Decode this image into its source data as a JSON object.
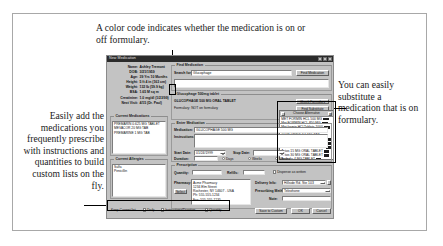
{
  "figure": {
    "captions": {
      "top": "A color code indicates whether the medication is on or off formulary.",
      "left": "Easily add the medications you frequently prescribe with instructions and quantities to build custom lists on the fly.",
      "right": "You can easily substitute a medication that is on formulary."
    }
  },
  "app": {
    "title": "New Medication",
    "window_buttons": [
      "minimize",
      "maximize",
      "close"
    ],
    "patient": [
      {
        "key": "Name:",
        "value": "Ashley Tremont"
      },
      {
        "key": "DOB:",
        "value": "3/21/1959"
      },
      {
        "key": "Age:",
        "value": "39 Yrs 10 Months"
      },
      {
        "key": "Height:",
        "value": "5 ft 4 in (163 cm)"
      },
      {
        "key": "Weight:",
        "value": "132 lb (59.9 kg)"
      },
      {
        "key": "BSA:",
        "value": "1.65 M sq m"
      },
      {
        "key": "Creatinine:",
        "value": "1.0 mg/dl (1/23/99)"
      },
      {
        "key": "Next Visit:",
        "value": "4/15 (Dr. Paul)"
      }
    ],
    "find_medication": {
      "legend": "Find Medication",
      "search_label": "Search for:",
      "search_value": "Glucophage",
      "search_button": "Find Medication",
      "results_value": ""
    },
    "selected": {
      "legend": "Glucophage 500mg tablet",
      "name": "GLUCOPHAGE 500 MG ORAL TABLET",
      "desc_label": "Formulary: NOT on formulary",
      "btn_formulary": "Check Formulary",
      "btn_substitute": "Find Substitute"
    },
    "substitute_list": {
      "header": "Choose Alternative",
      "close_label": "x",
      "items": [
        {
          "name": "MET FORMIN HCL 500 MG",
          "code": "ON"
        },
        {
          "name": "Met FORMIN HCL 850 MG",
          "code": "ON"
        },
        {
          "name": "Met formin HCl Tablets 1000",
          "code": "ON"
        },
        {
          "name": "GLYB URIDE 5 MG TAB",
          "code": "ON"
        },
        {
          "name": "GLYB URIDE 2.5 MG TAB",
          "code": "ON"
        },
        {
          "name": "Glipizide 5 MG ORAL TABLET",
          "code": "ON"
        },
        {
          "name": "Glipizide 10 MG ORAL TABLET",
          "code": "ON"
        },
        {
          "name": "Glucotrol XL 5 MG ORAL TABLET",
          "code": "ON"
        },
        {
          "name": "Actos 15 MG ORAL TABLET",
          "code": "OFF"
        },
        {
          "name": "Actos 30 MG ORAL TABLET",
          "code": "OFF"
        },
        {
          "name": "Avandia 4 MG TABLET",
          "code": "OFF"
        }
      ]
    },
    "current_medications": {
      "legend": "Current Medications",
      "items": [
        "PREMARIN 0.625 MG TABLET",
        "MEVACOR 20 MG TAB",
        "PREMARINE 1 MG TAB"
      ]
    },
    "current_allergies": {
      "legend": "Current Allergies",
      "items": [
        "Sulfa",
        "Penicillin"
      ]
    },
    "enter_medication": {
      "legend": "Enter Medication",
      "medication_label": "Medication:",
      "medication_value": "GLUCOPHAGE 500 MG",
      "instructions_label": "Instructions:",
      "instructions_value": "",
      "start_date_label": "Start Date:",
      "start_date_value": "01/24/1999",
      "stop_date_label": "Stop Date:",
      "stop_date_value": "",
      "duration_label": "Duration:",
      "duration_value": "",
      "duration_units": [
        "Days",
        "Weeks",
        "Months"
      ]
    },
    "prescription": {
      "legend": "Prescription",
      "quantity_label": "Quantity:",
      "quantity_value": "",
      "refills_label": "Refills:",
      "refills_value": "",
      "dispense_label": "Dispense as written",
      "pharmacy_label": "Pharmacy:",
      "pharmacy_select_button": "Select",
      "pharmacy_value": "Acme Pharmacy\n1234 Elm Street\nRochester, NY 14607 - USA\nPh: 555-555-1234\nFax: 555-555-1235",
      "delivery_label": "Delivery Info:",
      "delivery_value": "Hillside Rd. Ste 103",
      "prescribing_label": "Prescribing Method:",
      "prescribing_value": "Telephone",
      "notes_label": "Note:",
      "notes_value": ""
    },
    "footer": {
      "checkboxes": [
        {
          "label": "Keep Current list",
          "checked": false
        },
        {
          "label": "Daily",
          "checked": false
        },
        {
          "label": "Instructions/Duration",
          "checked": false
        },
        {
          "label": "Quantity",
          "checked": false
        }
      ],
      "buttons": [
        "Save to Custom",
        "OK",
        "Cancel"
      ]
    }
  }
}
